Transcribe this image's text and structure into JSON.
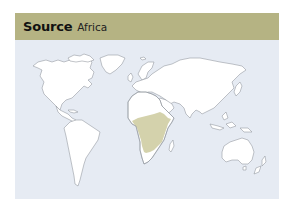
{
  "header": {
    "title": "Source",
    "subtitle": "Africa"
  },
  "map": {
    "highlighted_region": "Sub-Saharan Africa",
    "colors": {
      "header_bg": "#b5b383",
      "map_bg": "#e6ebf3",
      "land": "#ffffff",
      "highlight": "#d4d2ac",
      "outline": "#8e939a"
    }
  }
}
